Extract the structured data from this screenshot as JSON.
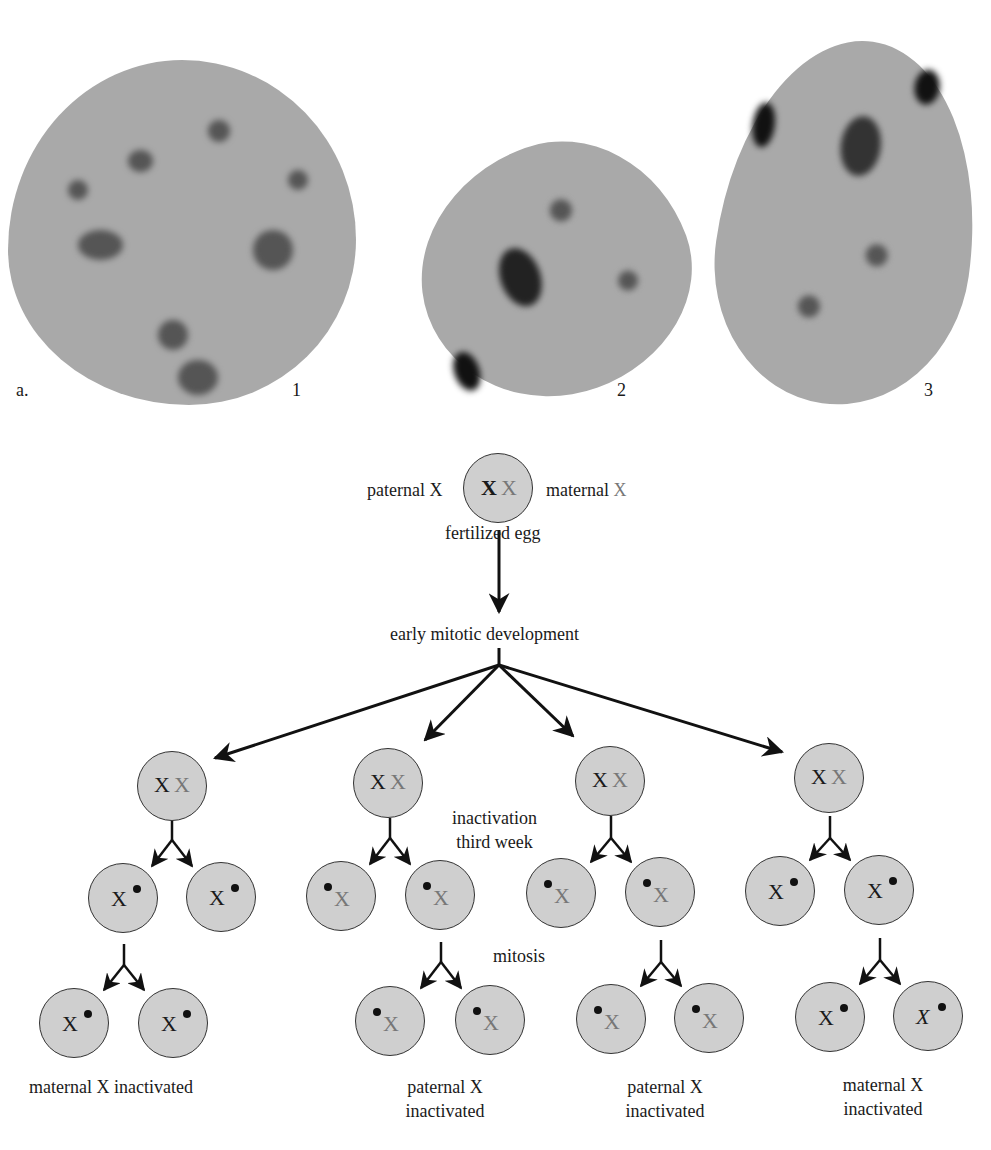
{
  "figure": {
    "panel_label": "a.",
    "nuclei_numbers": [
      "1",
      "2",
      "3"
    ]
  },
  "diagram": {
    "top_cell": {
      "left_label": "paternal X",
      "right_label_text": "maternal ",
      "right_label_x": "X",
      "x_paternal": "X",
      "x_maternal": "X",
      "caption": "fertilized egg"
    },
    "stage_label": "early mitotic development",
    "inactivation_label_line1": "inactivation",
    "inactivation_label_line2": "third week",
    "mitosis_label": "mitosis",
    "cell_x": "X",
    "branches": [
      {
        "result_line1": "maternal X inactivated",
        "result_line2": ""
      },
      {
        "result_line1": "paternal X",
        "result_line2": "inactivated"
      },
      {
        "result_line1": "paternal X",
        "result_line2": "inactivated"
      },
      {
        "result_line1": "maternal X",
        "result_line2": "inactivated"
      }
    ]
  },
  "colors": {
    "cell_fill": "#cfcfcf",
    "paternal_x": "#1a1a1a",
    "maternal_x": "#777777"
  }
}
